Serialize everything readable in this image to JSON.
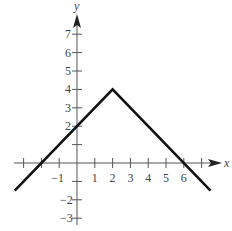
{
  "chart_data": {
    "type": "line",
    "title": "",
    "xlabel": "x",
    "ylabel": "y",
    "xlim": [
      -3.5,
      7.5
    ],
    "ylim": [
      -3.5,
      7.8
    ],
    "x_ticks": [
      -3,
      -2,
      -1,
      1,
      2,
      3,
      4,
      5,
      6,
      7
    ],
    "x_tick_labels": [
      "-1",
      "1",
      "2",
      "3",
      "4",
      "5",
      "6"
    ],
    "x_tick_label_values": [
      -1,
      1,
      2,
      3,
      4,
      5,
      6
    ],
    "y_ticks": [
      -3,
      -2,
      -1,
      1,
      2,
      3,
      4,
      5,
      6,
      7
    ],
    "y_tick_labels": [
      "7",
      "6",
      "5",
      "4",
      "3",
      "2",
      "-2",
      "-3"
    ],
    "y_tick_label_values": [
      7,
      6,
      5,
      4,
      3,
      2,
      -2,
      -3
    ],
    "grid": false,
    "series": [
      {
        "name": "f(x)",
        "x": [
          -3.5,
          2,
          7.5
        ],
        "y": [
          -1.5,
          4,
          -1.5
        ],
        "color": "#111111"
      }
    ]
  }
}
